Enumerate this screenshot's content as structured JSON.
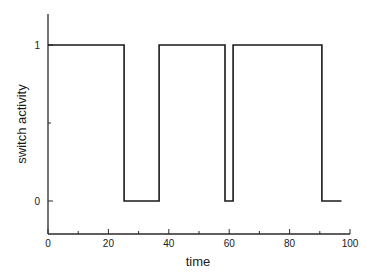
{
  "chart_data": {
    "type": "line",
    "title": "",
    "xlabel": "time",
    "ylabel": "switch activity",
    "xlim": [
      0,
      100
    ],
    "ylim": [
      -0.2,
      1.2
    ],
    "grid": false,
    "legend": null,
    "x_ticks": [
      0,
      20,
      40,
      60,
      80,
      100
    ],
    "x_tick_labels": [
      "0",
      "20",
      "40",
      "60",
      "80",
      "100"
    ],
    "y_ticks": [
      0,
      1
    ],
    "y_tick_labels": [
      "0",
      "1"
    ],
    "series": [
      {
        "name": "switch activity",
        "step": true,
        "color": "#1a1a1a",
        "x": [
          0,
          25.2,
          25.2,
          36.8,
          36.8,
          58.6,
          58.6,
          61.3,
          61.3,
          90.7,
          90.7,
          97.2
        ],
        "y": [
          1,
          1,
          0,
          0,
          1,
          1,
          0,
          0,
          1,
          1,
          0,
          0
        ]
      }
    ]
  }
}
